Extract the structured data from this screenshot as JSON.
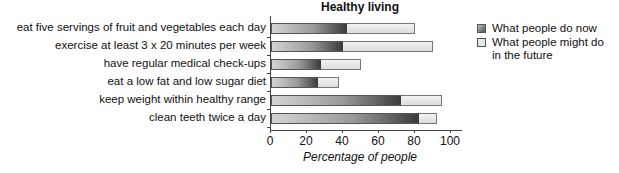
{
  "chart_data": {
    "type": "bar",
    "orientation": "horizontal",
    "stacked": true,
    "title": "Healthy living",
    "xlabel": "Percentage of people",
    "ylabel": "",
    "xlim": [
      0,
      100
    ],
    "xticks": [
      "0",
      "20",
      "40",
      "60",
      "80",
      "100"
    ],
    "categories": [
      "eat five servings of fruit and vegetables each day",
      "exercise at least 3 x 20 minutes per week",
      "have regular medical check-ups",
      "eat a low fat and low sugar diet",
      "keep weight within healthy range",
      "clean teeth twice a day"
    ],
    "series": [
      {
        "name": "What people do now",
        "values": [
          42,
          40,
          28,
          26,
          72,
          82
        ],
        "color": "#3a3a3a"
      },
      {
        "name": "What people might do in the future",
        "values": [
          80,
          90,
          50,
          38,
          95,
          92
        ],
        "color": "#e0e0e0"
      }
    ],
    "grid": false,
    "legend_position": "right"
  },
  "legend": {
    "now": "What people do now",
    "future_line1": "What people might do",
    "future_line2": "in the future"
  }
}
